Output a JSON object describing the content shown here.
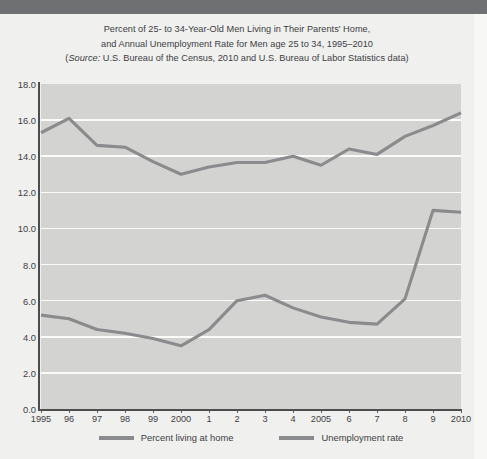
{
  "chart_data": {
    "type": "line",
    "title": "Percent of 25- to 34-Year-Old Men Living in Their Parents' Home, and Annual Unemployment Rate for Men age 25 to 34, 1995–2010",
    "title_lines": [
      "Percent of 25- to 34-Year-Old Men Living in Their Parents' Home,",
      "and Annual Unemployment Rate for Men age 25 to 34, 1995–2010"
    ],
    "source_prefix": "Source:",
    "source_line": "(Source: U.S. Bureau of the Census, 2010 and U.S. Bureau of Labor Statistics data)",
    "source_rest": " U.S. Bureau of the Census, 2010 and U.S. Bureau of Labor Statistics data)",
    "source_open_paren": "(",
    "xlabel": "",
    "ylabel": "",
    "ylim": [
      0.0,
      18.0
    ],
    "ytick_step": 2.0,
    "grid": true,
    "legend_position": "bottom",
    "categories": [
      "1995",
      "96",
      "97",
      "98",
      "99",
      "2000",
      "1",
      "2",
      "3",
      "4",
      "2005",
      "6",
      "7",
      "8",
      "9",
      "2010"
    ],
    "x_values": [
      1995,
      1996,
      1997,
      1998,
      1999,
      2000,
      2001,
      2002,
      2003,
      2004,
      2005,
      2006,
      2007,
      2008,
      2009,
      2010
    ],
    "ytick_labels": [
      "0.0",
      "2.0",
      "4.0",
      "6.0",
      "8.0",
      "10.0",
      "12.0",
      "14.0",
      "16.0",
      "18.0"
    ],
    "ytick_values": [
      0.0,
      2.0,
      4.0,
      6.0,
      8.0,
      10.0,
      12.0,
      14.0,
      16.0,
      18.0
    ],
    "series": [
      {
        "name": "Percent living at home",
        "color": "#8a8b8c",
        "values": [
          15.3,
          16.1,
          14.6,
          14.5,
          13.7,
          13.0,
          13.4,
          13.65,
          13.65,
          14.0,
          13.5,
          14.4,
          14.1,
          15.1,
          15.7,
          16.4
        ]
      },
      {
        "name": "Unemployment rate",
        "color": "#8a8b8c",
        "values": [
          5.2,
          5.0,
          4.4,
          4.2,
          3.9,
          3.5,
          4.4,
          6.0,
          6.3,
          5.6,
          5.1,
          4.8,
          4.7,
          6.1,
          11.0,
          10.9
        ]
      }
    ]
  },
  "legend": {
    "items": [
      {
        "label": "Percent living at home",
        "color": "#8a8b8c"
      },
      {
        "label": "Unemployment rate",
        "color": "#8a8b8c"
      }
    ]
  },
  "colors": {
    "page_background": "#f0f0ef",
    "plot_background": "#d3d3d2",
    "gridline": "#fbfbfa",
    "axis": "#4b4c4e",
    "line": "#8a8b8c",
    "text": "#3c3d3f",
    "top_band": "#6f7072"
  }
}
